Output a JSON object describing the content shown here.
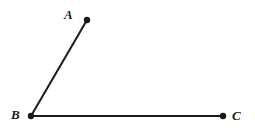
{
  "figure": {
    "kind": "geometry-angle-diagram",
    "width": 255,
    "height": 132,
    "background_color": "#ffffff",
    "stroke_color": "#1a1a1a",
    "stroke_width": 2,
    "dot_radius": 3,
    "points": [
      {
        "id": "A",
        "label": "A",
        "x": 87,
        "y": 20,
        "label_x": 64,
        "label_y": 8
      },
      {
        "id": "B",
        "label": "B",
        "x": 31,
        "y": 116,
        "label_x": 11,
        "label_y": 108
      },
      {
        "id": "C",
        "label": "C",
        "x": 223,
        "y": 116,
        "label_x": 232,
        "label_y": 109
      }
    ],
    "segments": [
      {
        "id": "BA",
        "from": "B",
        "to": "A",
        "x1": 31,
        "y1": 116,
        "x2": 87,
        "y2": 20
      },
      {
        "id": "BC",
        "from": "B",
        "to": "C",
        "x1": 31,
        "y1": 116,
        "x2": 223,
        "y2": 116
      }
    ],
    "vertex": "B",
    "watermark_text": ""
  }
}
